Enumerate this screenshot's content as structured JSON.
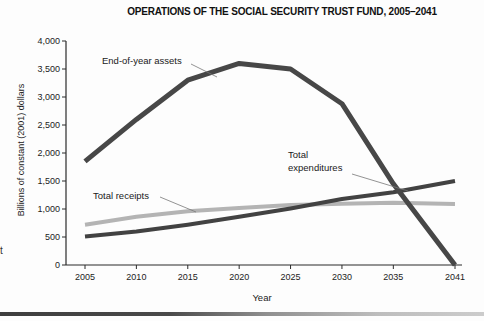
{
  "artifacts": {
    "left_edge_text": "t"
  },
  "chart_data": {
    "type": "line",
    "title": "OPERATIONS OF THE SOCIAL SECURITY TRUST FUND, 2005–2041",
    "xlabel": "Year",
    "ylabel": "Billions of constant (2001) dollars",
    "xlim": [
      2005,
      2041
    ],
    "ylim": [
      0,
      4000
    ],
    "grid": false,
    "legend_position": "inline-annotations",
    "x_ticks": [
      2005,
      2010,
      2015,
      2020,
      2025,
      2030,
      2035,
      2041
    ],
    "x_tick_labels": [
      "2005",
      "2010",
      "2015",
      "2020",
      "2025",
      "2030",
      "2035",
      "2041"
    ],
    "y_ticks": [
      0,
      500,
      1000,
      1500,
      2000,
      2500,
      3000,
      3500,
      4000
    ],
    "y_tick_labels": [
      "0",
      "500",
      "1,000",
      "1,500",
      "2,000",
      "2,500",
      "3,000",
      "3,500",
      "4,000"
    ],
    "x": [
      2005,
      2010,
      2015,
      2020,
      2025,
      2030,
      2035,
      2041
    ],
    "series": [
      {
        "name": "End-of-year assets",
        "color": "#474747",
        "stroke_width": 5,
        "values": [
          1850,
          2600,
          3300,
          3600,
          3500,
          2880,
          1450,
          0
        ]
      },
      {
        "name": "Total receipts",
        "color": "#b4b4b4",
        "stroke_width": 4,
        "values": [
          720,
          860,
          960,
          1020,
          1070,
          1095,
          1110,
          1090
        ]
      },
      {
        "name": "Total expenditures",
        "color": "#424242",
        "stroke_width": 4,
        "values": [
          510,
          600,
          720,
          860,
          1010,
          1180,
          1300,
          1500
        ]
      }
    ],
    "axis_color": "#2b2b2b",
    "text_color": "#1c1c1c"
  }
}
